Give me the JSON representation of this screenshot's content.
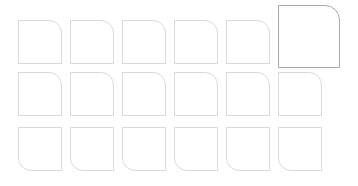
{
  "canvas": {
    "width": 358,
    "height": 186,
    "background": "#ffffff",
    "description": "Grid of rounded-corner square outlines on a white background"
  },
  "style": {
    "tile_border_color": "#d9d9d9",
    "tile_fill_color": "#ffffff",
    "selected_border_color": "#a8a8a8",
    "corner_radius": 13,
    "selected_corner_radius": 15,
    "border_width": 1
  },
  "grid": {
    "columns": 6,
    "rows": 3,
    "origin_x": 18,
    "origin_y": 20,
    "column_pitch": 52,
    "row_pitch": 52,
    "tile_width": 44,
    "tile_height": 44
  },
  "tiles": [
    {
      "id": "tile-r1-c1",
      "row": 1,
      "col": 1,
      "x": 18,
      "y": 20,
      "w": 44,
      "h": 44,
      "corner": "top-right",
      "selected": false
    },
    {
      "id": "tile-r1-c2",
      "row": 1,
      "col": 2,
      "x": 70,
      "y": 20,
      "w": 44,
      "h": 44,
      "corner": "top-right",
      "selected": false
    },
    {
      "id": "tile-r1-c3",
      "row": 1,
      "col": 3,
      "x": 122,
      "y": 20,
      "w": 44,
      "h": 44,
      "corner": "top-right",
      "selected": false
    },
    {
      "id": "tile-r1-c4",
      "row": 1,
      "col": 4,
      "x": 174,
      "y": 20,
      "w": 44,
      "h": 44,
      "corner": "top-right",
      "selected": false
    },
    {
      "id": "tile-r1-c5",
      "row": 1,
      "col": 5,
      "x": 226,
      "y": 20,
      "w": 44,
      "h": 44,
      "corner": "top-right",
      "selected": false
    },
    {
      "id": "tile-r1-c6",
      "row": 1,
      "col": 6,
      "x": 278,
      "y": 5,
      "w": 62,
      "h": 63,
      "corner": "top-right",
      "selected": true
    },
    {
      "id": "tile-r2-c1",
      "row": 2,
      "col": 1,
      "x": 18,
      "y": 72,
      "w": 44,
      "h": 44,
      "corner": "top-right",
      "selected": false
    },
    {
      "id": "tile-r2-c2",
      "row": 2,
      "col": 2,
      "x": 70,
      "y": 72,
      "w": 44,
      "h": 44,
      "corner": "top-right",
      "selected": false
    },
    {
      "id": "tile-r2-c3",
      "row": 2,
      "col": 3,
      "x": 122,
      "y": 72,
      "w": 44,
      "h": 44,
      "corner": "top-right",
      "selected": false
    },
    {
      "id": "tile-r2-c4",
      "row": 2,
      "col": 4,
      "x": 174,
      "y": 72,
      "w": 44,
      "h": 44,
      "corner": "top-right",
      "selected": false
    },
    {
      "id": "tile-r2-c5",
      "row": 2,
      "col": 5,
      "x": 226,
      "y": 72,
      "w": 44,
      "h": 44,
      "corner": "top-right",
      "selected": false
    },
    {
      "id": "tile-r2-c6",
      "row": 2,
      "col": 6,
      "x": 278,
      "y": 72,
      "w": 44,
      "h": 44,
      "corner": "top-right",
      "selected": false
    },
    {
      "id": "tile-r3-c1",
      "row": 3,
      "col": 1,
      "x": 18,
      "y": 127,
      "w": 44,
      "h": 44,
      "corner": "bottom-left",
      "selected": false
    },
    {
      "id": "tile-r3-c2",
      "row": 3,
      "col": 2,
      "x": 70,
      "y": 127,
      "w": 44,
      "h": 44,
      "corner": "bottom-left",
      "selected": false
    },
    {
      "id": "tile-r3-c3",
      "row": 3,
      "col": 3,
      "x": 122,
      "y": 127,
      "w": 44,
      "h": 44,
      "corner": "bottom-left",
      "selected": false
    },
    {
      "id": "tile-r3-c4",
      "row": 3,
      "col": 4,
      "x": 174,
      "y": 127,
      "w": 44,
      "h": 44,
      "corner": "bottom-left",
      "selected": false
    },
    {
      "id": "tile-r3-c5",
      "row": 3,
      "col": 5,
      "x": 226,
      "y": 127,
      "w": 44,
      "h": 44,
      "corner": "bottom-left",
      "selected": false
    },
    {
      "id": "tile-r3-c6",
      "row": 3,
      "col": 6,
      "x": 278,
      "y": 127,
      "w": 44,
      "h": 44,
      "corner": "bottom-left",
      "selected": false
    }
  ]
}
